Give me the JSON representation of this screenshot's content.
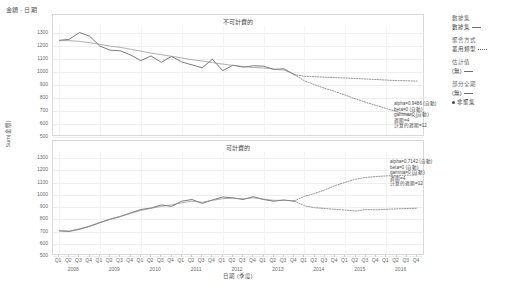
{
  "caption": "金額 - 日期",
  "axes": {
    "y_title": "Sum(金額)",
    "x_title": "日期 (季度)"
  },
  "legend": {
    "groups": [
      {
        "name": "數據集",
        "items": [
          {
            "label": "數據集",
            "marker": "line"
          }
        ]
      },
      {
        "name": "聚合方式",
        "items": [
          {
            "label": "叢用類型",
            "marker": "dash-dots"
          }
        ]
      },
      {
        "name": "估計值",
        "items": [
          {
            "label": "(無)",
            "marker": "line"
          }
        ]
      },
      {
        "name": "部分全期",
        "items": [
          {
            "label": "(無)",
            "marker": "line"
          }
        ]
      },
      {
        "name": "",
        "items": [
          {
            "label": "非聚集",
            "marker": "dot"
          }
        ]
      }
    ]
  },
  "chart_data": [
    {
      "type": "line",
      "title": "不可計費的",
      "panel": "top",
      "xlabel": "日期 (季度)",
      "ylabel": "Sum(金額)",
      "ylim": [
        500,
        1350
      ],
      "yticks": [
        1300,
        1200,
        1100,
        1000,
        900,
        800,
        700,
        600,
        500
      ],
      "grid": true,
      "annotation": [
        "alpha=0.9486 (自動)",
        "beta=0 (自動)",
        "gamma=0 (自動)",
        "週期=4",
        "計算的週期=12"
      ],
      "x": [
        "2008 Q1",
        "2008 Q2",
        "2008 Q3",
        "2008 Q4",
        "2009 Q1",
        "2009 Q2",
        "2009 Q3",
        "2009 Q4",
        "2010 Q1",
        "2010 Q2",
        "2010 Q3",
        "2010 Q4",
        "2011 Q1",
        "2011 Q2",
        "2011 Q3",
        "2011 Q4",
        "2012 Q1",
        "2012 Q2",
        "2012 Q3",
        "2012 Q4",
        "2013 Q1",
        "2013 Q2",
        "2013 Q3",
        "2013 Q4",
        "2014 Q1",
        "2014 Q2",
        "2014 Q3",
        "2014 Q4",
        "2015 Q1",
        "2015 Q2",
        "2015 Q3",
        "2015 Q4",
        "2016 Q1",
        "2016 Q2",
        "2016 Q3",
        "2016 Q4"
      ],
      "series": [
        {
          "name": "實際值",
          "style": "solid",
          "values": [
            1240,
            1248,
            1300,
            1272,
            1196,
            1165,
            1160,
            1128,
            1085,
            1120,
            1072,
            1118,
            1075,
            1052,
            1030,
            1095,
            1008,
            1050,
            1035,
            1045,
            1042,
            1018,
            1022,
            978,
            null,
            null,
            null,
            null,
            null,
            null,
            null,
            null,
            null,
            null,
            null,
            null
          ]
        },
        {
          "name": "趨勢",
          "style": "solid-2",
          "values": [
            1238,
            1238,
            1232,
            1222,
            1210,
            1196,
            1186,
            1172,
            1158,
            1142,
            1130,
            1118,
            1106,
            1092,
            1082,
            1070,
            1058,
            1048,
            1040,
            1032,
            1028,
            1020,
            1012,
            982,
            null,
            null,
            null,
            null,
            null,
            null,
            null,
            null,
            null,
            null,
            null,
            null
          ]
        },
        {
          "name": "預測上界",
          "style": "dotted",
          "values": [
            null,
            null,
            null,
            null,
            null,
            null,
            null,
            null,
            null,
            null,
            null,
            null,
            null,
            null,
            null,
            null,
            null,
            null,
            null,
            null,
            null,
            null,
            null,
            978,
            965,
            962,
            958,
            955,
            952,
            948,
            944,
            940,
            936,
            932,
            930,
            928
          ]
        },
        {
          "name": "預測下界",
          "style": "dotted",
          "values": [
            null,
            null,
            null,
            null,
            null,
            null,
            null,
            null,
            null,
            null,
            null,
            null,
            null,
            null,
            null,
            null,
            null,
            null,
            null,
            null,
            null,
            null,
            null,
            978,
            930,
            900,
            872,
            848,
            820,
            792,
            766,
            742,
            718,
            694,
            672,
            650
          ]
        }
      ]
    },
    {
      "type": "line",
      "title": "可計費的",
      "panel": "bottom",
      "xlabel": "日期 (季度)",
      "ylabel": "Sum(金額)",
      "ylim": [
        500,
        1350
      ],
      "yticks": [
        1300,
        1200,
        1100,
        1000,
        900,
        800,
        700,
        600,
        500
      ],
      "grid": true,
      "annotation": [
        "alpha=0.7142 (自動)",
        "beta=0 (自動)",
        "gamma=0 (自動)",
        "週期=4",
        "計算的週期=12"
      ],
      "x": [
        "2008 Q1",
        "2008 Q2",
        "2008 Q3",
        "2008 Q4",
        "2009 Q1",
        "2009 Q2",
        "2009 Q3",
        "2009 Q4",
        "2010 Q1",
        "2010 Q2",
        "2010 Q3",
        "2010 Q4",
        "2011 Q1",
        "2011 Q2",
        "2011 Q3",
        "2011 Q4",
        "2012 Q1",
        "2012 Q2",
        "2012 Q3",
        "2012 Q4",
        "2013 Q1",
        "2013 Q2",
        "2013 Q3",
        "2013 Q4",
        "2014 Q1",
        "2014 Q2",
        "2014 Q3",
        "2014 Q4",
        "2015 Q1",
        "2015 Q2",
        "2015 Q3",
        "2015 Q4",
        "2016 Q1",
        "2016 Q2",
        "2016 Q3",
        "2016 Q4"
      ],
      "series": [
        {
          "name": "實際值",
          "style": "solid",
          "values": [
            705,
            700,
            718,
            742,
            772,
            800,
            822,
            852,
            880,
            892,
            918,
            905,
            948,
            962,
            930,
            958,
            982,
            975,
            962,
            985,
            962,
            948,
            958,
            948,
            null,
            null,
            null,
            null,
            null,
            null,
            null,
            null,
            null,
            null,
            null,
            null
          ]
        },
        {
          "name": "趨勢",
          "style": "solid-2",
          "values": [
            708,
            704,
            722,
            745,
            775,
            802,
            825,
            848,
            872,
            890,
            905,
            918,
            935,
            948,
            940,
            955,
            968,
            972,
            968,
            975,
            965,
            955,
            955,
            950,
            null,
            null,
            null,
            null,
            null,
            null,
            null,
            null,
            null,
            null,
            null,
            null
          ]
        },
        {
          "name": "預測上界",
          "style": "dotted",
          "values": [
            null,
            null,
            null,
            null,
            null,
            null,
            null,
            null,
            null,
            null,
            null,
            null,
            null,
            null,
            null,
            null,
            null,
            null,
            null,
            null,
            null,
            null,
            null,
            950,
            988,
            1012,
            1040,
            1075,
            1102,
            1128,
            1142,
            1150,
            1155,
            1158,
            1160,
            1162
          ]
        },
        {
          "name": "預測下界",
          "style": "dotted",
          "values": [
            null,
            null,
            null,
            null,
            null,
            null,
            null,
            null,
            null,
            null,
            null,
            null,
            null,
            null,
            null,
            null,
            null,
            null,
            null,
            null,
            null,
            null,
            null,
            950,
            910,
            895,
            888,
            882,
            875,
            868,
            880,
            878,
            882,
            885,
            888,
            890
          ]
        }
      ]
    }
  ],
  "xaxis": {
    "quarters": [
      "Q1",
      "Q2",
      "Q3",
      "Q4",
      "Q1",
      "Q2",
      "Q3",
      "Q4",
      "Q1",
      "Q2",
      "Q3",
      "Q4",
      "Q1",
      "Q2",
      "Q3",
      "Q4",
      "Q1",
      "Q2",
      "Q3",
      "Q4",
      "Q1",
      "Q2",
      "Q3",
      "Q4",
      "Q1",
      "Q2",
      "Q3",
      "Q4",
      "Q1",
      "Q2",
      "Q3",
      "Q4",
      "Q1",
      "Q2",
      "Q3",
      "Q4"
    ],
    "years": [
      "2008",
      "2009",
      "2010",
      "2011",
      "2012",
      "2013",
      "2014",
      "2015",
      "2016"
    ]
  }
}
